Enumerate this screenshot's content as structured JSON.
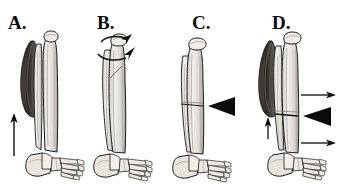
{
  "figure": {
    "background_color": "#ffffff",
    "ink_color": "#111111",
    "width": 340,
    "height": 196,
    "panels": [
      {
        "id": "a",
        "label": "A.",
        "label_x": 8,
        "label_y": 13,
        "description": "Lower leg with tibia and fibula, shaded posterior muscle belly on the lateral side, foot skeleton, and a thin straight upward arrow along the medial side",
        "annotations": [
          {
            "name": "up-arrow",
            "kind": "straight-arrow",
            "direction": "up"
          }
        ]
      },
      {
        "id": "b",
        "label": "B.",
        "label_x": 97,
        "label_y": 13,
        "description": "Lower leg bones with foot skeleton and two curved rotational arrows around the proximal tibia indicating torsion",
        "annotations": [
          {
            "name": "rotation-arrow-upper",
            "kind": "curved-arrow",
            "direction": "clockwise"
          },
          {
            "name": "rotation-arrow-lower",
            "kind": "curved-arrow",
            "direction": "clockwise"
          }
        ]
      },
      {
        "id": "c",
        "label": "C.",
        "label_x": 192,
        "label_y": 13,
        "description": "Lower leg bones with foot skeleton and a solid black triangular arrowhead pointing left at a mid-shaft fracture line",
        "annotations": [
          {
            "name": "fracture-arrowhead",
            "kind": "solid-triangle",
            "direction": "left"
          }
        ]
      },
      {
        "id": "d",
        "label": "D.",
        "label_x": 272,
        "label_y": 13,
        "description": "Lower leg with shaded muscle belly, foot skeleton, two thin leftward-origin arrows pointing right, a solid black triangular arrowhead pointing left at the fracture, and a small upward arrow at the muscle insertion",
        "annotations": [
          {
            "name": "displacement-arrow-upper",
            "kind": "straight-arrow",
            "direction": "right"
          },
          {
            "name": "fracture-arrowhead",
            "kind": "solid-triangle",
            "direction": "left"
          },
          {
            "name": "displacement-arrow-lower",
            "kind": "straight-arrow",
            "direction": "right"
          },
          {
            "name": "muscle-pull-arrow",
            "kind": "straight-arrow",
            "direction": "up"
          }
        ]
      }
    ]
  }
}
